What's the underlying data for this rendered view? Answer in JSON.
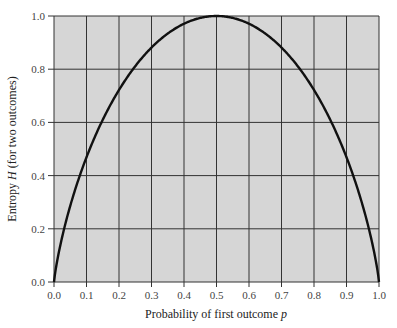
{
  "chart_data": {
    "type": "line",
    "title": "",
    "xlabel": "Probability of first outcome p",
    "xlabel_main": "Probability of first outcome ",
    "xlabel_var": "p",
    "ylabel": "Entropy H (for two outcomes)",
    "ylabel_pre": "Entropy ",
    "ylabel_var": "H",
    "ylabel_post": " (for two outcomes)",
    "xlim": [
      0.0,
      1.0
    ],
    "ylim": [
      0.0,
      1.0
    ],
    "xticks": [
      "0.0",
      "0.1",
      "0.2",
      "0.3",
      "0.4",
      "0.5",
      "0.6",
      "0.7",
      "0.8",
      "0.9",
      "1.0"
    ],
    "yticks": [
      "0.0",
      "0.2",
      "0.4",
      "0.6",
      "0.8",
      "1.0"
    ],
    "grid": true,
    "legend": null,
    "series": [
      {
        "name": "H(p) = -p log2 p - (1-p) log2 (1-p)",
        "x": [
          0.0,
          0.01,
          0.05,
          0.1,
          0.2,
          0.3,
          0.4,
          0.5,
          0.6,
          0.7,
          0.8,
          0.9,
          0.95,
          0.99,
          1.0
        ],
        "y": [
          0.0,
          0.081,
          0.286,
          0.469,
          0.722,
          0.881,
          0.971,
          1.0,
          0.971,
          0.881,
          0.722,
          0.469,
          0.286,
          0.081,
          0.0
        ]
      }
    ]
  },
  "colors": {
    "plot_background": "#d6d6d6",
    "grid": "#333333",
    "curve": "#111111",
    "text": "#444444"
  }
}
